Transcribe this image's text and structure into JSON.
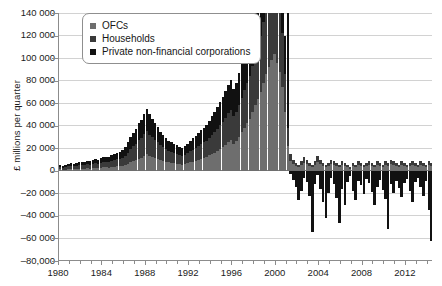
{
  "chart_data": {
    "type": "bar",
    "title": "",
    "subtitle": "",
    "xlabel": "",
    "ylabel": "£ millions per quarter",
    "stacked": true,
    "grid": true,
    "legend_position": "top-left",
    "ylim": [
      -80000,
      140000
    ],
    "ytick_labels": [
      "140 000",
      "120 000",
      "100 000",
      "80 000",
      "60 000",
      "40 000",
      "20 000",
      "0",
      "–20 000",
      "–40 000",
      "–60 000",
      "–80,000"
    ],
    "ytick_values": [
      140000,
      120000,
      100000,
      80000,
      60000,
      40000,
      20000,
      0,
      -20000,
      -40000,
      -60000,
      -80000
    ],
    "xtick_labels": [
      "1980",
      "1984",
      "1988",
      "1992",
      "1996",
      "2000",
      "2004",
      "2008",
      "2012"
    ],
    "xtick_values": [
      1980,
      1984,
      1988,
      1992,
      1996,
      2000,
      2004,
      2008,
      2012
    ],
    "xlim": [
      1980,
      2014.5
    ],
    "legend": [
      {
        "label": "OFCs",
        "color": "#6e6e6e"
      },
      {
        "label": "Households",
        "color": "#3a3a3a"
      },
      {
        "label": "Private non-financial corporations",
        "color": "#111111"
      }
    ],
    "series": [
      {
        "name": "OFCs",
        "color": "#6e6e6e",
        "values": [
          1200,
          900,
          1100,
          1300,
          1500,
          1400,
          1600,
          1800,
          1700,
          1900,
          2100,
          2000,
          2400,
          2600,
          2300,
          2800,
          3000,
          3200,
          2900,
          3400,
          3600,
          3900,
          4200,
          4600,
          5200,
          6400,
          7800,
          8600,
          9200,
          10400,
          11200,
          12800,
          14600,
          13200,
          12400,
          11600,
          10800,
          9600,
          8800,
          8200,
          7600,
          7000,
          6800,
          6400,
          6000,
          5600,
          6200,
          6800,
          7400,
          8200,
          9000,
          9800,
          10600,
          11400,
          12200,
          13600,
          14800,
          16200,
          17600,
          19400,
          21000,
          23000,
          25400,
          27000,
          24000,
          26500,
          30000,
          34000,
          38000,
          42000,
          46000,
          52000,
          58000,
          64000,
          70000,
          78000,
          86000,
          92000,
          98000,
          104000,
          96000,
          88000,
          74000,
          52000,
          22000,
          9000,
          6000,
          4000,
          3000,
          5000,
          7000,
          6000,
          4000,
          3000,
          5000,
          8000,
          6000,
          4000,
          3000,
          4000,
          6000,
          5000,
          4000,
          3000,
          5000,
          4000,
          3000,
          2000,
          4000,
          3000,
          5000,
          4000,
          3000,
          4000,
          5000,
          4000,
          3000,
          5000,
          4000,
          3000,
          5000,
          4000,
          6000,
          5000,
          4000,
          3000,
          5000,
          4000,
          3000,
          4000,
          5000,
          4000,
          3000,
          5000,
          4000,
          3000,
          5000,
          4000
        ]
      },
      {
        "name": "Households",
        "color": "#3a3a3a",
        "values": [
          2200,
          2000,
          2400,
          2600,
          2800,
          2700,
          3000,
          3200,
          3100,
          3400,
          3600,
          3500,
          3900,
          4200,
          4000,
          4400,
          4700,
          5000,
          4800,
          5400,
          5800,
          6200,
          6600,
          7200,
          8200,
          9800,
          11500,
          13000,
          14500,
          16500,
          17500,
          19500,
          21000,
          19000,
          17500,
          16000,
          14500,
          13000,
          12000,
          11000,
          10000,
          9500,
          9000,
          8500,
          8000,
          7500,
          8200,
          9000,
          9800,
          10600,
          11400,
          12200,
          13000,
          13800,
          14600,
          15800,
          17000,
          18400,
          19800,
          21200,
          22600,
          24000,
          25600,
          27000,
          24500,
          26000,
          28500,
          31000,
          33500,
          36000,
          38000,
          41000,
          44000,
          47000,
          50000,
          54000,
          58000,
          61000,
          64000,
          67000,
          62000,
          57000,
          48000,
          34000,
          16000,
          6000,
          4000,
          3000,
          2000,
          3500,
          5000,
          4000,
          3000,
          2000,
          3500,
          5500,
          4000,
          3000,
          2000,
          3000,
          4000,
          3500,
          3000,
          2000,
          3500,
          3000,
          2000,
          1500,
          3000,
          2000,
          3500,
          3000,
          2000,
          3000,
          3500,
          3000,
          2000,
          3500,
          3000,
          2000,
          3500,
          3000,
          4000,
          3500,
          3000,
          2000,
          3500,
          3000,
          2000,
          3000,
          3500,
          3000,
          2000,
          3500,
          3000,
          2000,
          3500,
          3000
        ]
      },
      {
        "name": "Private non-financial corporations",
        "color": "#111111",
        "values": [
          1800,
          1600,
          1900,
          2100,
          2300,
          2200,
          2500,
          2700,
          2600,
          2900,
          3100,
          3000,
          3400,
          3700,
          3500,
          3900,
          4200,
          4500,
          4300,
          4900,
          5300,
          5700,
          6100,
          6700,
          7600,
          9000,
          10800,
          12200,
          13600,
          15400,
          16400,
          18200,
          19600,
          17800,
          16400,
          15000,
          13600,
          12200,
          11200,
          10200,
          9200,
          8800,
          8400,
          7800,
          7400,
          6800,
          7600,
          8400,
          9200,
          10000,
          10800,
          11600,
          12400,
          13200,
          14000,
          15200,
          16400,
          17800,
          19200,
          20600,
          22000,
          23400,
          25000,
          26400,
          23800,
          25400,
          28000,
          30500,
          33000,
          35500,
          37500,
          40500,
          43500,
          46500,
          49500,
          53500,
          57500,
          60500,
          63500,
          66500,
          61500,
          56500,
          47500,
          33500,
          15500,
          -3000,
          -8000,
          -14000,
          -26000,
          -18000,
          -6000,
          -10000,
          -22000,
          -34000,
          -12000,
          -4000,
          -16000,
          -28000,
          -42000,
          -20000,
          -6000,
          -12000,
          -24000,
          -8000,
          -16000,
          -30000,
          -10000,
          -5000,
          -18000,
          -26000,
          -9000,
          -13000,
          -21000,
          -7000,
          -11000,
          -19000,
          -30000,
          -14000,
          -8000,
          -17000,
          -25000,
          -6000,
          -12000,
          -20000,
          -9000,
          -15000,
          -23000,
          -11000,
          -7000,
          -18000,
          -28000,
          -10000,
          -6000,
          -14000,
          -22000,
          -9000,
          -35000
        ]
      }
    ],
    "spikes": [
      {
        "index": 84,
        "value": 140000,
        "note": "2008 peak positive spike"
      },
      {
        "index": 93,
        "value": -54000,
        "note": "post-crisis trough"
      },
      {
        "index": 103,
        "value": -46000,
        "note": "trough"
      },
      {
        "index": 121,
        "value": -52000,
        "note": "trough"
      },
      {
        "index": 137,
        "value": -62000,
        "note": "final trough"
      }
    ]
  }
}
